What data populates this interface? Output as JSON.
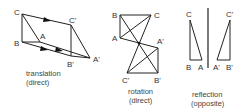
{
  "diagrams": {
    "translation": {
      "labels": {
        "C": "C",
        "B": "B",
        "A": "A",
        "C_prime": "C'",
        "B_prime": "B'",
        "A_prime": "A'"
      },
      "caption_line1": "translation",
      "caption_line2": "(direct)"
    },
    "rotation": {
      "labels": {
        "B": "B",
        "C": "C",
        "A": "A",
        "A_prime": "A'",
        "C_prime": "C'",
        "B_prime": "B'"
      },
      "caption_line1": "rotation",
      "caption_line2": "(direct)"
    },
    "reflection": {
      "labels": {
        "C": "C",
        "B": "B",
        "A": "A",
        "C_prime": "C'",
        "A_prime": "A'",
        "B_prime": "B'"
      },
      "caption_line1": "reflection",
      "caption_line2": "(opposite)"
    }
  },
  "colors": {
    "line": "#222222",
    "text": "#333333",
    "background": "#ffffff"
  }
}
